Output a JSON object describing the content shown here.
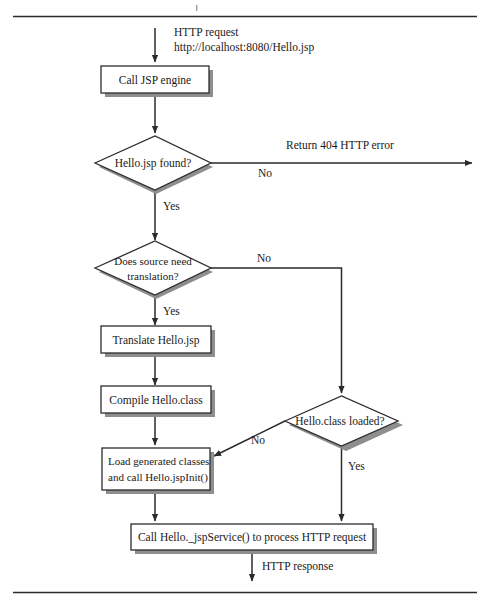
{
  "figure": {
    "type": "flowchart",
    "top_rule": true,
    "bottom_rule": true
  },
  "nodes": {
    "call_jsp_engine": {
      "id": "call-jsp-engine",
      "shape": "process",
      "label": "Call JSP engine"
    },
    "hello_jsp_found": {
      "id": "hello-jsp-found",
      "shape": "decision",
      "label": "Hello.jsp found?"
    },
    "does_source_need_translation": {
      "id": "does-source-need-translation",
      "shape": "decision",
      "label_line1": "Does source need",
      "label_line2": "translation?"
    },
    "translate_hello_jsp": {
      "id": "translate-hello-jsp",
      "shape": "process",
      "label": "Translate Hello.jsp"
    },
    "compile_hello_class": {
      "id": "compile-hello-class",
      "shape": "process",
      "label": "Compile Hello.class"
    },
    "hello_class_loaded": {
      "id": "hello-class-loaded",
      "shape": "decision",
      "label": "Hello.class loaded?"
    },
    "load_generated_classes": {
      "id": "load-generated-classes",
      "shape": "process",
      "label_line1": "Load generated classes",
      "label_line2": "and call Hello.jspInit()"
    },
    "call_jsp_service": {
      "id": "call-jsp-service",
      "shape": "process",
      "label": "Call Hello._jspService() to process HTTP request"
    }
  },
  "edges": {
    "http_request": {
      "label_line1": "HTTP request",
      "label_line2": "http://localhost:8080/Hello.jsp"
    },
    "found_no": {
      "label": "No"
    },
    "found_yes": {
      "label": "Yes"
    },
    "return_404": {
      "label": "Return 404 HTTP error"
    },
    "translation_no": {
      "label": "No"
    },
    "translation_yes": {
      "label": "Yes"
    },
    "loaded_no": {
      "label": "No"
    },
    "loaded_yes": {
      "label": "Yes"
    },
    "http_response": {
      "label": "HTTP response"
    }
  },
  "colors": {
    "line": "#2b2b2b",
    "shadow": "#8e8e8e",
    "fill": "#ffffff",
    "text": "#1a1a1a"
  }
}
